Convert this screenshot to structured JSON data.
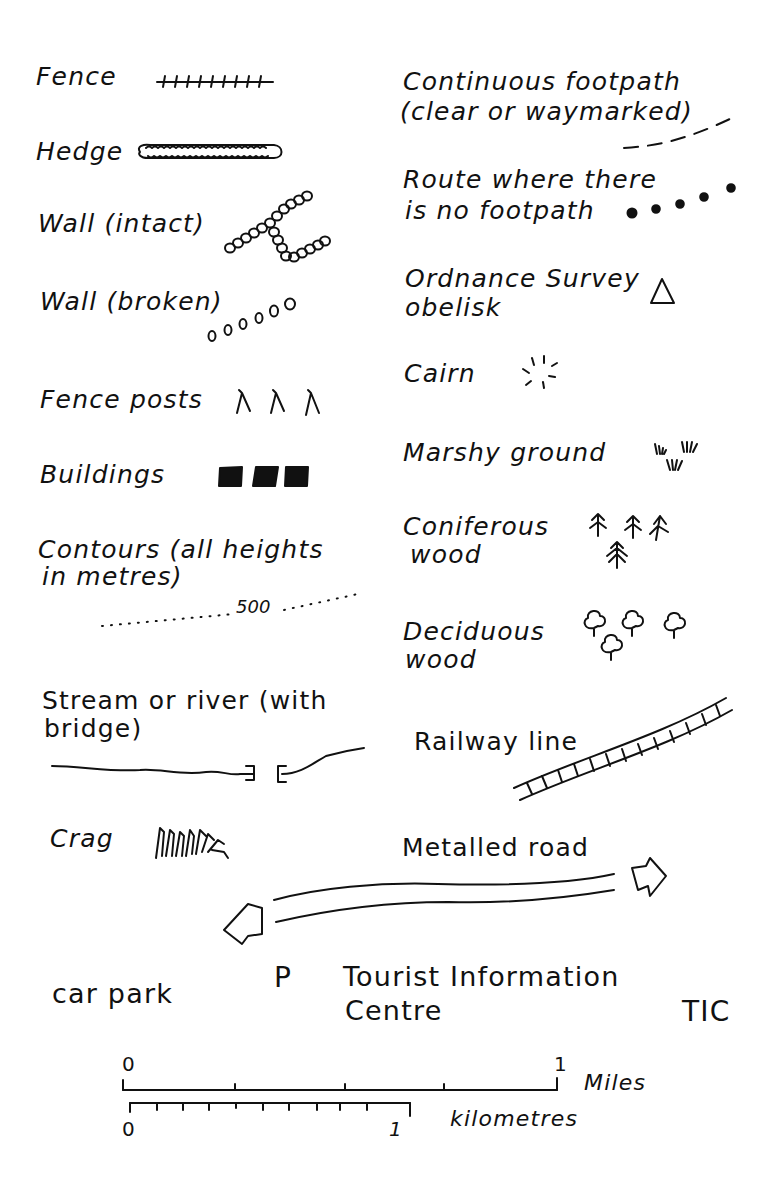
{
  "legend": {
    "left": [
      {
        "label": "Fence",
        "symbol": "fence-line"
      },
      {
        "label": "Hedge",
        "symbol": "hedge-line"
      },
      {
        "label": "Wall (intact)",
        "symbol": "wall-intact-circles"
      },
      {
        "label": "Wall (broken)",
        "symbol": "wall-broken-circles"
      },
      {
        "label": "Fence posts",
        "symbol": "fence-post-marks",
        "glyphs": [
          "⅄",
          "⅄",
          "⅄"
        ]
      },
      {
        "label": "Buildings",
        "symbol": "building-squares"
      },
      {
        "label": "Contours (all heights",
        "label2": "in metres)",
        "symbol": "contour-dotted-line",
        "contour_value": "500"
      },
      {
        "label": "Stream or river (with",
        "label2": "bridge)",
        "symbol": "stream-with-bridge"
      },
      {
        "label": "Crag",
        "symbol": "crag-marks"
      }
    ],
    "right": [
      {
        "label": "Continuous footpath",
        "label2": "(clear or waymarked)",
        "symbol": "dashed-footpath"
      },
      {
        "label": "Route where there",
        "label2": "is no footpath",
        "symbol": "dotted-route"
      },
      {
        "label": "Ordnance Survey",
        "label2": "obelisk",
        "symbol": "triangle",
        "glyph": "△"
      },
      {
        "label": "Cairn",
        "symbol": "cairn-burst"
      },
      {
        "label": "Marshy ground",
        "symbol": "marsh-tufts"
      },
      {
        "label": "Coniferous",
        "label2": "wood",
        "symbol": "conifer-trees"
      },
      {
        "label": "Deciduous",
        "label2": "wood",
        "symbol": "deciduous-trees"
      },
      {
        "label": "Railway line",
        "symbol": "railway-track"
      },
      {
        "label": "Metalled road",
        "symbol": "double-line-road-arrows"
      }
    ],
    "bottom": {
      "car_park": {
        "label": "car park",
        "symbol": "P"
      },
      "tic": {
        "label": "Tourist Information",
        "label2": "Centre",
        "symbol": "TIC"
      }
    }
  },
  "scale_bar": {
    "miles": {
      "start": "0",
      "end": "1",
      "unit": "Miles",
      "divisions": 4
    },
    "kilometres": {
      "start": "0",
      "end": "1",
      "unit": "kilometres",
      "divisions": 10
    }
  }
}
